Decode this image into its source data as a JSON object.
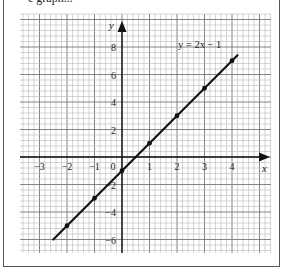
{
  "page": {
    "top_text_fragment": "e graph..."
  },
  "chart_data": {
    "type": "line",
    "title": "",
    "equation_label": "y = 2x − 1",
    "xlabel": "x",
    "ylabel": "y",
    "xlim": [
      -3.7,
      5.4
    ],
    "ylim": [
      -7,
      10.1
    ],
    "x_ticks": [
      "−3",
      "−2",
      "−1",
      "0",
      "1",
      "2",
      "3",
      "4"
    ],
    "x_tick_values": [
      -3,
      -2,
      -1,
      0,
      1,
      2,
      3,
      4
    ],
    "y_ticks": [
      "8",
      "6",
      "4",
      "2",
      "−2",
      "−4",
      "−6"
    ],
    "y_tick_values": [
      8,
      6,
      4,
      2,
      -2,
      -4,
      -6
    ],
    "grid": true,
    "series": [
      {
        "name": "y = 2x − 1",
        "line_extent": {
          "x": [
            -2.5,
            4.2
          ],
          "y": [
            -6,
            7.4
          ]
        },
        "points": [
          {
            "x": -2,
            "y": -5
          },
          {
            "x": -1,
            "y": -3
          },
          {
            "x": 0,
            "y": -1
          },
          {
            "x": 1,
            "y": 1
          },
          {
            "x": 2,
            "y": 3
          },
          {
            "x": 3,
            "y": 5
          },
          {
            "x": 4,
            "y": 7
          }
        ]
      }
    ]
  },
  "colors": {
    "grid_minor": "#b8b8b8",
    "grid_major": "#777777",
    "axis": "#111111",
    "line": "#111111"
  }
}
